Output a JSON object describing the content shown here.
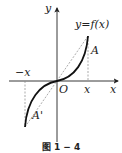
{
  "figure": {
    "caption": "图 1 − 4",
    "axis_x_label": "x",
    "axis_y_label": "y",
    "origin_label": "O",
    "function_label": "y=f(x)",
    "tick_pos_label": "x",
    "tick_neg_label": "−x",
    "point_a_label": "A",
    "point_a_prime_label": "A'"
  },
  "colors": {
    "ink": "#222222",
    "dashed": "#888888"
  }
}
